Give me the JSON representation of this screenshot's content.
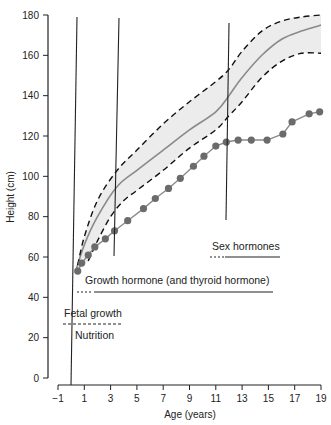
{
  "chart_data": {
    "type": "line",
    "title": "",
    "xlabel": "Age (years)",
    "ylabel": "Height (cm)",
    "xlim": [
      -1,
      19
    ],
    "ylim": [
      0,
      180
    ],
    "xticks": [
      "-1",
      "1",
      "3",
      "5",
      "7",
      "9",
      "11",
      "13",
      "15",
      "17",
      "19"
    ],
    "yticks": [
      "0",
      "20",
      "40",
      "60",
      "80",
      "100",
      "120",
      "140",
      "160",
      "180"
    ],
    "grid": false,
    "legend": null,
    "series": [
      {
        "name": "Normal growth (median)",
        "style": "solid gray",
        "points": [
          [
            0.3,
            52
          ],
          [
            1,
            66
          ],
          [
            2,
            80
          ],
          [
            3.5,
            95
          ],
          [
            5,
            103
          ],
          [
            7,
            113
          ],
          [
            9,
            123
          ],
          [
            11,
            132
          ],
          [
            12,
            140
          ],
          [
            13,
            149
          ],
          [
            14.5,
            160
          ],
          [
            16,
            168
          ],
          [
            17.5,
            172
          ],
          [
            19,
            175
          ]
        ]
      },
      {
        "name": "Upper normal limit",
        "style": "dashed black",
        "points": [
          [
            0.5,
            56
          ],
          [
            1,
            70
          ],
          [
            2,
            88
          ],
          [
            3.5,
            103
          ],
          [
            5,
            113
          ],
          [
            7,
            126
          ],
          [
            9,
            137
          ],
          [
            11,
            147
          ],
          [
            12,
            153
          ],
          [
            13,
            162
          ],
          [
            14.5,
            172
          ],
          [
            16,
            177
          ],
          [
            17.5,
            179
          ],
          [
            19,
            180
          ]
        ]
      },
      {
        "name": "Lower normal limit",
        "style": "dashed black",
        "points": [
          [
            1.3,
            58
          ],
          [
            2,
            68
          ],
          [
            3,
            80
          ],
          [
            4,
            88
          ],
          [
            5,
            93
          ],
          [
            7,
            103
          ],
          [
            9,
            114
          ],
          [
            11,
            123
          ],
          [
            12,
            130
          ],
          [
            13,
            137
          ],
          [
            14.5,
            149
          ],
          [
            16,
            157
          ],
          [
            17.5,
            161
          ],
          [
            19,
            161
          ]
        ]
      },
      {
        "name": "Patient height",
        "style": "gray line with dots",
        "points": [
          [
            0.5,
            53
          ],
          [
            0.8,
            57
          ],
          [
            1.3,
            61
          ],
          [
            1.8,
            65
          ],
          [
            2.6,
            69
          ],
          [
            3.3,
            73
          ],
          [
            4.3,
            78
          ],
          [
            5.5,
            84
          ],
          [
            6.4,
            89
          ],
          [
            7.4,
            94
          ],
          [
            8.3,
            99
          ],
          [
            9.3,
            105
          ],
          [
            10.1,
            110
          ],
          [
            11,
            115
          ],
          [
            11.8,
            117
          ],
          [
            12.7,
            118
          ],
          [
            13.7,
            118
          ],
          [
            14.9,
            118
          ],
          [
            16.1,
            121
          ],
          [
            16.8,
            127
          ],
          [
            18.1,
            131
          ],
          [
            18.9,
            132
          ]
        ]
      }
    ],
    "vertical_markers": [
      {
        "age": 0,
        "label": "Birth"
      },
      {
        "age": 3.3,
        "label": ""
      },
      {
        "age": 11.8,
        "label": ""
      }
    ],
    "annotations": [
      {
        "text": "Sex hormones",
        "age_range": [
          10.7,
          16
        ],
        "height": 60,
        "line": "dashed then solid"
      },
      {
        "text": "Growth hormone (and thyroid hormone)",
        "age_range": [
          -0.3,
          15.8
        ],
        "height": 46,
        "line": "dashed then solid"
      },
      {
        "text": "Fetal growth",
        "age_range": [
          -0.6,
          3.7
        ],
        "height": 27,
        "line": "dashed"
      },
      {
        "text": "Nutrition",
        "age_range": [
          0,
          3.4
        ],
        "height": 20,
        "line": "none"
      }
    ]
  },
  "labels": {
    "xlabel": "Age (years)",
    "ylabel": "Height (cm)",
    "sex_hormones": "Sex hormones",
    "growth_hormone": "Growth hormone (and thyroid hormone)",
    "fetal_growth": "Fetal growth",
    "nutrition": "Nutrition"
  },
  "colors": {
    "band_fill": "#ececec",
    "median_line": "#8a8a8a",
    "dashed_limits": "#111111",
    "patient_line": "#8a8a8a",
    "patient_dots": "#6b6b6b",
    "axis": "#222222"
  }
}
